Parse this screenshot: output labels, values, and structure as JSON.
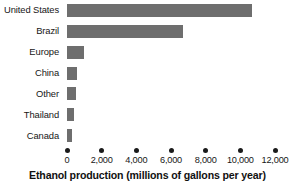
{
  "chart_data": {
    "type": "bar",
    "orientation": "horizontal",
    "title": "",
    "xlabel": "Ethanol production (millions of gallons per year)",
    "ylabel": "",
    "categories": [
      "United States",
      "Brazil",
      "Europe",
      "China",
      "Other",
      "Thailand",
      "Canada"
    ],
    "values": [
      10700,
      6700,
      1000,
      600,
      500,
      400,
      300
    ],
    "series": [
      {
        "name": "Ethanol production",
        "values": [
          10700,
          6700,
          1000,
          600,
          500,
          400,
          300
        ]
      }
    ],
    "xlim": [
      0,
      12000
    ],
    "xticks": [
      0,
      2000,
      4000,
      6000,
      8000,
      10000,
      12000
    ],
    "xtick_labels": [
      "0",
      "2,000",
      "4,000",
      "6,000",
      "8,000",
      "10,000",
      "12,000"
    ],
    "grid": false,
    "legend": false,
    "bar_color": "#6e6e6e",
    "tick_marker": "dot",
    "axis_color": "#1a1a1a"
  }
}
